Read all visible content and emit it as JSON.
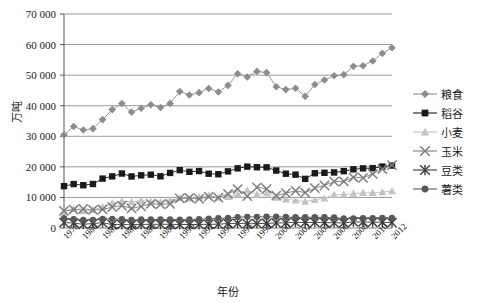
{
  "chart_data": {
    "type": "line",
    "title": "",
    "xlabel": "年份",
    "ylabel": "万吨",
    "ylim": [
      0,
      70000
    ],
    "ytick_step": 10000,
    "yticks": [
      "0",
      "10 000",
      "20 000",
      "30 000",
      "40 000",
      "50 000",
      "60 000",
      "70 000"
    ],
    "grid": "horizontal",
    "legend_position": "right",
    "x": [
      1978,
      1979,
      1980,
      1981,
      1982,
      1983,
      1984,
      1985,
      1986,
      1987,
      1988,
      1989,
      1990,
      1991,
      1992,
      1993,
      1994,
      1995,
      1996,
      1997,
      1998,
      1999,
      2000,
      2001,
      2002,
      2003,
      2004,
      2005,
      2006,
      2007,
      2008,
      2009,
      2010,
      2011,
      2012
    ],
    "xtick_labels": [
      "1978",
      "1980",
      "1982",
      "1984",
      "1986",
      "1988",
      "1990",
      "1992",
      "1994",
      "1996",
      "1998",
      "2000",
      "2002",
      "2004",
      "2006",
      "2008",
      "2010",
      "2012"
    ],
    "series": [
      {
        "name": "粮食",
        "marker": "diamond",
        "color": "#8c8c8c",
        "values": [
          30477,
          33212,
          32056,
          32502,
          35450,
          38728,
          40731,
          37911,
          39151,
          40298,
          39408,
          40755,
          44624,
          43529,
          44266,
          45649,
          44510,
          46662,
          50454,
          49417,
          51230,
          50839,
          46218,
          45264,
          45706,
          43070,
          46947,
          48402,
          49804,
          50160,
          52871,
          53082,
          54648,
          57121,
          58957
        ]
      },
      {
        "name": "稻谷",
        "marker": "square",
        "color": "#1a1a1a",
        "values": [
          13693,
          14375,
          13991,
          14396,
          16160,
          16887,
          17826,
          16857,
          17222,
          17442,
          16911,
          18013,
          18933,
          18381,
          18622,
          17751,
          17593,
          18523,
          19510,
          20073,
          19871,
          19849,
          18791,
          17758,
          17454,
          16066,
          17909,
          18059,
          18172,
          18603,
          19190,
          19510,
          19576,
          20100,
          20424
        ]
      },
      {
        "name": "小麦",
        "marker": "triangle",
        "color": "#c3c3c3",
        "values": [
          5384,
          6273,
          5521,
          5964,
          6846,
          8139,
          8782,
          8581,
          9004,
          8590,
          8543,
          9081,
          9823,
          9595,
          10159,
          10639,
          9930,
          10221,
          11057,
          12329,
          10973,
          11388,
          9964,
          9387,
          9029,
          8649,
          9195,
          9745,
          10847,
          10930,
          11246,
          11512,
          11518,
          11740,
          12102
        ]
      },
      {
        "name": "玉米",
        "marker": "cross",
        "color": "#7d7d7d",
        "values": [
          5595,
          6004,
          6260,
          5921,
          6056,
          6821,
          7341,
          6383,
          7086,
          7924,
          7735,
          7893,
          9682,
          9877,
          9538,
          10270,
          9928,
          11199,
          12747,
          10431,
          13295,
          12809,
          10600,
          11409,
          12131,
          11583,
          13029,
          13937,
          15160,
          15230,
          16591,
          16397,
          17725,
          19278,
          20561
        ]
      },
      {
        "name": "豆类",
        "marker": "asterisk",
        "color": "#3a3a3a",
        "values": [
          1767,
          1626,
          1189,
          1481,
          1720,
          11,
          1,
          0,
          0,
          0,
          0,
          0,
          0,
          0,
          0,
          0,
          0,
          0,
          0,
          0,
          0,
          0,
          0,
          0,
          0,
          0,
          0,
          0,
          0,
          0,
          0,
          0,
          0,
          0,
          0
        ]
      },
      {
        "name": "薯类",
        "marker": "circle",
        "color": "#595959",
        "values": [
          3174,
          2881,
          2604,
          2628,
          2938,
          2987,
          2905,
          2616,
          2757,
          2805,
          2757,
          2813,
          2743,
          2768,
          2864,
          3061,
          3197,
          3287,
          3573,
          3646,
          3644,
          3663,
          3680,
          3579,
          3516,
          3514,
          3528,
          3519,
          3418,
          3107,
          3136,
          3177,
          3221,
          3276,
          3300
        ]
      }
    ],
    "series_beans_values": [
      1767,
      1626,
      1189,
      1481,
      1720,
      1109,
      1145,
      1050,
      1161,
      1218,
      1218,
      1232,
      1121,
      1137,
      1160,
      1216,
      1240,
      1459,
      1529,
      1385,
      1442,
      1510,
      1650,
      1671,
      1874,
      1756,
      1852,
      1770,
      1705,
      1640,
      2010,
      1965,
      1897,
      1880,
      1740
    ]
  },
  "legend": {
    "items": [
      {
        "label": "粮食",
        "marker": "diamond",
        "color": "#8c8c8c"
      },
      {
        "label": "稻谷",
        "marker": "square",
        "color": "#1a1a1a"
      },
      {
        "label": "小麦",
        "marker": "triangle",
        "color": "#c3c3c3"
      },
      {
        "label": "玉米",
        "marker": "cross",
        "color": "#7d7d7d"
      },
      {
        "label": "豆类",
        "marker": "asterisk",
        "color": "#3a3a3a"
      },
      {
        "label": "薯类",
        "marker": "circle",
        "color": "#595959"
      }
    ]
  },
  "axes": {
    "y_title": "万吨",
    "x_title": "年份"
  }
}
